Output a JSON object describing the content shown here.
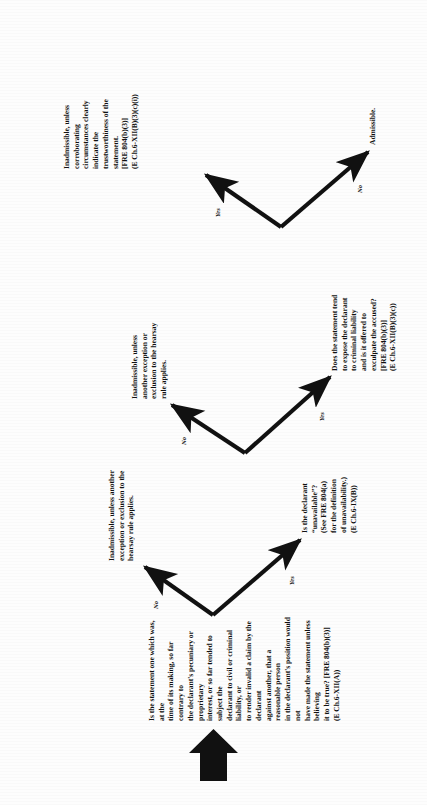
{
  "diagram": {
    "type": "decision-flowchart",
    "orientation": "rotated-90-counterclockwise",
    "title_visible": false,
    "ink_color": "#111111",
    "background_color": "#ffffff"
  },
  "start": {
    "marker": "up-arrow-block",
    "label": ""
  },
  "nodes": {
    "q1": {
      "id": "q1",
      "kind": "question",
      "text_lines": [
        "Is the statement one which was, at the",
        "time of its making, so far contrary to",
        "the declarant's pecuniary or proprietary",
        "interest, or so far tended to subject the",
        "declarant to civil or criminal liability, or",
        "to render invalid a claim by the declarant",
        "against another, that a reasonable person",
        "in the declarant's position would not",
        "have made the statement unless believing",
        "it to be true? [FRE 804(b)(3)]",
        "(E Ch.6-XII(A))"
      ],
      "emphasis": "contrary to"
    },
    "r1_no": {
      "id": "r1_no",
      "kind": "result",
      "text_lines": [
        "Inadmissible, unless another",
        "exception or exclusion to the",
        "hearsay rule applies."
      ],
      "bold_lead": "Inadmissible,"
    },
    "q2": {
      "id": "q2",
      "kind": "question",
      "text_lines": [
        "Is the declarant",
        "“unavailable”?",
        "(See FRE 804(a)",
        "for the definition",
        "of unavailability.)",
        "(E Ch.6-IX(B))"
      ]
    },
    "r2_no": {
      "id": "r2_no",
      "kind": "result",
      "text_lines": [
        "Inadmissible, unless",
        "another exception or",
        "exclusion to the hearsay",
        "rule applies."
      ],
      "bold_lead": "Inadmissible,"
    },
    "q3": {
      "id": "q3",
      "kind": "question",
      "text_lines": [
        "Does the statement tend",
        "to expose the declarant",
        "to criminal liability",
        "and is it offered to",
        "exculpate the accused?",
        "[FRE 804(b)(3)]",
        "(E Ch.6-XII(B)(3)(c))"
      ]
    },
    "r3_yes": {
      "id": "r3_yes",
      "kind": "result",
      "text_lines": [
        "Inadmissible, unless",
        "corroborating",
        "circumstances clearly",
        "indicate the",
        "trustworthiness of the",
        "statement.",
        "[FRE 804(b)(3)]",
        "(E Ch.6-XII(B)(3)(c)(i))"
      ],
      "bold_lead": "Inadmissible,"
    },
    "r3_no": {
      "id": "r3_no",
      "kind": "result",
      "text_lines": [
        "Admissible."
      ]
    }
  },
  "edges": [
    {
      "id": "e1",
      "from": "q1",
      "to": "r1_no",
      "label": "No"
    },
    {
      "id": "e2",
      "from": "q1",
      "to": "q2",
      "label": "Yes"
    },
    {
      "id": "e3",
      "from": "q2",
      "to": "r2_no",
      "label": "No"
    },
    {
      "id": "e4",
      "from": "q2",
      "to": "q3",
      "label": "Yes"
    },
    {
      "id": "e5",
      "from": "q3",
      "to": "r3_yes",
      "label": "Yes"
    },
    {
      "id": "e6",
      "from": "q3",
      "to": "r3_no",
      "label": "No"
    }
  ]
}
